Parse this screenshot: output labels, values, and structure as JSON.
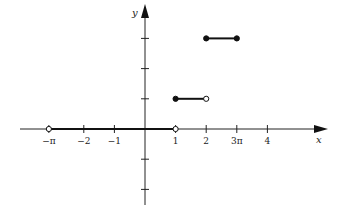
{
  "chart_data": {
    "type": "line",
    "title": "",
    "xlabel": "x",
    "ylabel": "y",
    "xlim": [
      -3.3,
      5.7
    ],
    "ylim": [
      -2.3,
      4.0
    ],
    "grid": false,
    "x_ticks": [
      {
        "value": -3.14159,
        "label": "−π"
      },
      {
        "value": -2,
        "label": "−2"
      },
      {
        "value": -1,
        "label": "−1"
      },
      {
        "value": 1,
        "label": "1"
      },
      {
        "value": 2,
        "label": "2"
      },
      {
        "value": 3,
        "label": "3π"
      },
      {
        "value": 4,
        "label": "4"
      }
    ],
    "y_ticks": [
      -2,
      -1,
      1,
      2,
      3
    ],
    "segments": [
      {
        "x": [
          -3.14159,
          1
        ],
        "y": 0,
        "left_closed": false,
        "right_closed": false
      },
      {
        "x": [
          1,
          2
        ],
        "y": 1,
        "left_closed": true,
        "right_closed": false
      },
      {
        "x": [
          2,
          3
        ],
        "y": 3,
        "left_closed": true,
        "right_closed": true
      }
    ]
  }
}
